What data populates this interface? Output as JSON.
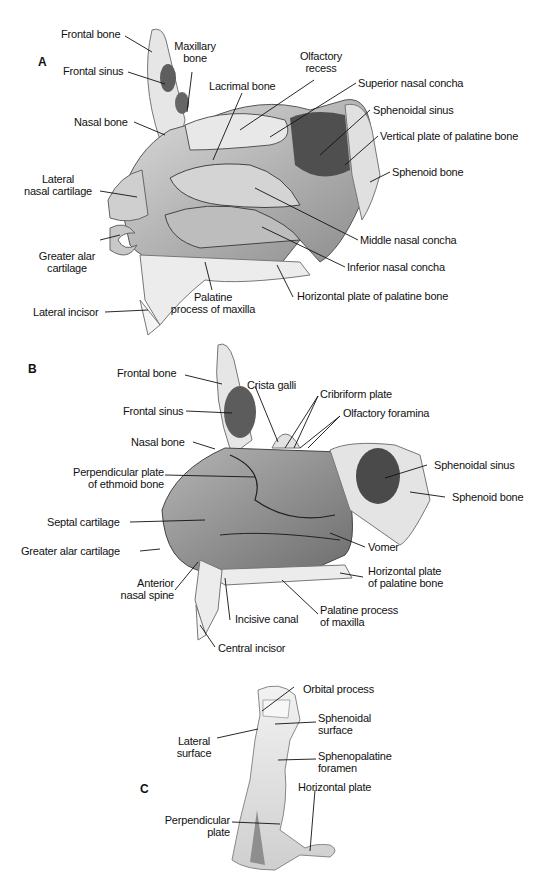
{
  "figure": {
    "panels": [
      {
        "id": "A",
        "letter": "A",
        "labels": {
          "frontal_bone": "Frontal bone",
          "maxillary_bone_1": "Maxillary",
          "maxillary_bone_2": "bone",
          "frontal_sinus": "Frontal sinus",
          "olfactory_recess_1": "Olfactory",
          "olfactory_recess_2": "recess",
          "lacrimal_bone": "Lacrimal bone",
          "superior_nasal_concha": "Superior nasal concha",
          "sphenoidal_sinus": "Sphenoidal sinus",
          "nasal_bone": "Nasal bone",
          "vertical_plate": "Vertical plate of palatine bone",
          "lateral_nasal_cartilage_1": "Lateral",
          "lateral_nasal_cartilage_2": "nasal cartilage",
          "sphenoid_bone": "Sphenoid bone",
          "middle_nasal_concha": "Middle nasal concha",
          "greater_alar_cartilage_1": "Greater alar",
          "greater_alar_cartilage_2": "cartilage",
          "inferior_nasal_concha": "Inferior nasal concha",
          "palatine_process_1": "Palatine",
          "palatine_process_2": "process of maxilla",
          "horizontal_plate": "Horizontal plate of palatine bone",
          "lateral_incisor": "Lateral incisor"
        }
      },
      {
        "id": "B",
        "letter": "B",
        "labels": {
          "frontal_bone": "Frontal bone",
          "crista_galli": "Crista galli",
          "cribriform_plate": "Cribriform plate",
          "frontal_sinus": "Frontal sinus",
          "olfactory_foramina": "Olfactory foramina",
          "nasal_bone": "Nasal bone",
          "perpendicular_plate_1": "Perpendicular plate",
          "perpendicular_plate_2": "of ethmoid bone",
          "sphenoidal_sinus": "Sphenoidal sinus",
          "septal_cartilage": "Septal cartilage",
          "sphenoid_bone": "Sphenoid bone",
          "vomer": "Vomer",
          "greater_alar_cartilage": "Greater alar cartilage",
          "horizontal_plate_1": "Horizontal plate",
          "horizontal_plate_2": "of palatine bone",
          "anterior_nasal_spine_1": "Anterior",
          "anterior_nasal_spine_2": "nasal spine",
          "incisive_canal": "Incisive canal",
          "palatine_process_1": "Palatine process",
          "palatine_process_2": "of maxilla",
          "central_incisor": "Central incisor"
        }
      },
      {
        "id": "C",
        "letter": "C",
        "labels": {
          "orbital_process": "Orbital process",
          "sphenoidal_surface_1": "Sphenoidal",
          "sphenoidal_surface_2": "surface",
          "lateral_surface_1": "Lateral",
          "lateral_surface_2": "surface",
          "sphenopalatine_foramen_1": "Sphenopalatine",
          "sphenopalatine_foramen_2": "foramen",
          "horizontal_plate": "Horizontal plate",
          "perpendicular_plate_1": "Perpendicular",
          "perpendicular_plate_2": "plate"
        }
      }
    ],
    "colors": {
      "bone_light": "#ebebeb",
      "bone_mid": "#c9c9c9",
      "tissue_dark": "#7a7a7a",
      "sinus_dark": "#5a5a5a",
      "line": "#111111"
    }
  }
}
